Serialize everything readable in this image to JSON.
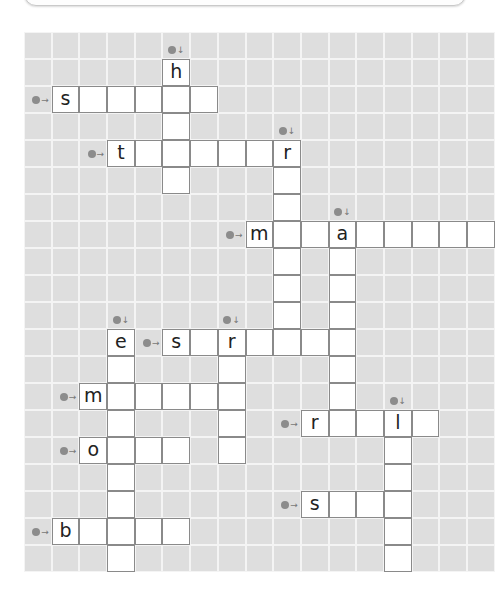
{
  "puzzle": {
    "type": "crossword",
    "cols": 17,
    "rows": 20,
    "clue_numbers_note": "Clue numbers inside circular markers are not legible in the screenshot; numbering here is assumed sequential.",
    "entries": [
      {
        "number": 1,
        "number_legible": false,
        "direction": "down",
        "marker": [
          0,
          5
        ],
        "start": [
          1,
          5
        ],
        "length": 5,
        "given": "h"
      },
      {
        "number": 2,
        "number_legible": false,
        "direction": "across",
        "marker": [
          2,
          0
        ],
        "start": [
          2,
          1
        ],
        "length": 6,
        "given": "s"
      },
      {
        "number": 3,
        "number_legible": false,
        "direction": "down",
        "marker": [
          3,
          9
        ],
        "start": [
          4,
          9
        ],
        "length": 7,
        "given": "r"
      },
      {
        "number": 4,
        "number_legible": false,
        "direction": "across",
        "marker": [
          4,
          2
        ],
        "start": [
          4,
          3
        ],
        "length": 7,
        "given": "t"
      },
      {
        "number": 5,
        "number_legible": false,
        "direction": "down",
        "marker": [
          6,
          11
        ],
        "start": [
          7,
          11
        ],
        "length": 8,
        "given": "a"
      },
      {
        "number": 6,
        "number_legible": false,
        "direction": "across",
        "marker": [
          7,
          7
        ],
        "start": [
          7,
          8
        ],
        "length": 9,
        "given": "m"
      },
      {
        "number": 7,
        "number_legible": false,
        "direction": "down",
        "marker": [
          10,
          3
        ],
        "start": [
          11,
          3
        ],
        "length": 9,
        "given": "e"
      },
      {
        "number": 8,
        "number_legible": false,
        "direction": "down",
        "marker": [
          10,
          7
        ],
        "start": [
          11,
          7
        ],
        "length": 5,
        "given": "r"
      },
      {
        "number": 9,
        "number_legible": false,
        "direction": "across",
        "marker": [
          11,
          4
        ],
        "start": [
          11,
          5
        ],
        "length": 7,
        "given": "s"
      },
      {
        "number": 10,
        "number_legible": false,
        "direction": "across",
        "marker": [
          13,
          1
        ],
        "start": [
          13,
          2
        ],
        "length": 6,
        "given": "m"
      },
      {
        "number": 11,
        "number_legible": false,
        "direction": "down",
        "marker": [
          13,
          13
        ],
        "start": [
          14,
          13
        ],
        "length": 6,
        "given": "l"
      },
      {
        "number": 12,
        "number_legible": false,
        "direction": "across",
        "marker": [
          14,
          9
        ],
        "start": [
          14,
          10
        ],
        "length": 5,
        "given": "r"
      },
      {
        "number": 13,
        "number_legible": false,
        "direction": "across",
        "marker": [
          15,
          1
        ],
        "start": [
          15,
          2
        ],
        "length": 4,
        "given": "o"
      },
      {
        "number": 14,
        "number_legible": false,
        "direction": "across",
        "marker": [
          17,
          9
        ],
        "start": [
          17,
          10
        ],
        "length": 4,
        "given": "s"
      },
      {
        "number": 15,
        "number_legible": false,
        "direction": "across",
        "marker": [
          18,
          0
        ],
        "start": [
          18,
          1
        ],
        "length": 5,
        "given": "b"
      }
    ],
    "symbols": {
      "across_arrow": "→",
      "down_arrow": "↓"
    },
    "colors": {
      "background_cell": "#dedede",
      "answer_cell": "#ffffff",
      "answer_border": "#8a8a8a",
      "marker_dot": "#8c8c8c"
    }
  }
}
